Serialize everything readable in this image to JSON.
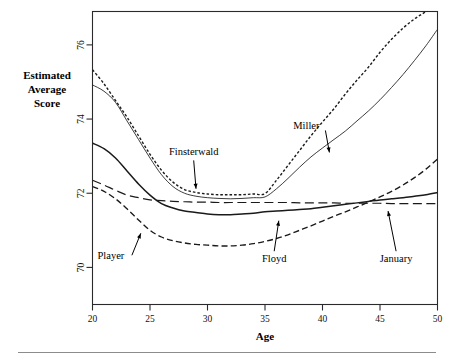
{
  "figure": {
    "background_color": "#ffffff",
    "frame_color": "#2a2a2a"
  },
  "chart_data": {
    "type": "line",
    "title": "",
    "subtitle": "",
    "xlabel": "Age",
    "ylabel": "Estimated Average Score",
    "xlim": [
      20,
      50
    ],
    "ylim": [
      69.0,
      76.9
    ],
    "grid": false,
    "legend_position": "inline-annotations",
    "x_ticks": [
      20,
      25,
      30,
      35,
      40,
      45,
      50
    ],
    "x_tick_labels": [
      "20",
      "25",
      "30",
      "35",
      "40",
      "45",
      "50"
    ],
    "y_ticks": [
      70,
      72,
      74,
      76
    ],
    "y_tick_labels": [
      "70",
      "72",
      "74",
      "76"
    ],
    "series": [
      {
        "name": "Finsterwald",
        "style": "dotted",
        "x": [
          20,
          21,
          22,
          23,
          24,
          25,
          26,
          27,
          28,
          29,
          30,
          31,
          32,
          33,
          34,
          35,
          36,
          37,
          38,
          39,
          40,
          41,
          42,
          43,
          44,
          45,
          46,
          47,
          48,
          49,
          50
        ],
        "y": [
          75.33,
          74.95,
          74.5,
          74.05,
          73.55,
          73.05,
          72.62,
          72.3,
          72.1,
          72.02,
          71.98,
          71.96,
          71.96,
          71.96,
          71.98,
          71.99,
          72.35,
          72.75,
          73.15,
          73.55,
          73.92,
          74.28,
          74.68,
          75.05,
          75.4,
          75.8,
          76.15,
          76.45,
          76.7,
          76.9,
          77.1
        ]
      },
      {
        "name": "Miller",
        "style": "solid-thin",
        "x": [
          20,
          21,
          22,
          23,
          24,
          25,
          26,
          27,
          28,
          29,
          30,
          31,
          32,
          33,
          34,
          35,
          36,
          37,
          38,
          39,
          40,
          41,
          42,
          43,
          44,
          45,
          46,
          47,
          48,
          49,
          50
        ],
        "y": [
          74.92,
          74.75,
          74.45,
          73.95,
          73.45,
          72.95,
          72.5,
          72.18,
          72.0,
          71.92,
          71.88,
          71.86,
          71.85,
          71.86,
          71.88,
          71.9,
          72.12,
          72.4,
          72.7,
          72.98,
          73.22,
          73.45,
          73.68,
          73.95,
          74.22,
          74.52,
          74.85,
          75.2,
          75.58,
          75.98,
          76.42
        ]
      },
      {
        "name": "Player",
        "style": "dashed",
        "x": [
          20,
          21,
          22,
          23,
          24,
          25,
          26,
          27,
          28,
          29,
          30,
          31,
          32,
          33,
          34,
          35,
          36,
          37,
          38,
          39,
          40,
          41,
          42,
          43,
          44,
          45,
          46,
          47,
          48,
          49,
          50
        ],
        "y": [
          72.18,
          72.05,
          71.85,
          71.58,
          71.28,
          71.0,
          70.82,
          70.72,
          70.66,
          70.62,
          70.6,
          70.58,
          70.58,
          70.6,
          70.64,
          70.7,
          70.78,
          70.88,
          71.0,
          71.12,
          71.25,
          71.38,
          71.5,
          71.63,
          71.76,
          71.9,
          72.05,
          72.22,
          72.42,
          72.65,
          72.92
        ]
      },
      {
        "name": "Floyd",
        "style": "solid",
        "x": [
          20,
          21,
          22,
          23,
          24,
          25,
          26,
          27,
          28,
          29,
          30,
          31,
          32,
          33,
          34,
          35,
          36,
          37,
          38,
          39,
          40,
          41,
          42,
          43,
          44,
          45,
          46,
          47,
          48,
          49,
          50
        ],
        "y": [
          73.35,
          73.2,
          72.95,
          72.6,
          72.25,
          71.95,
          71.72,
          71.6,
          71.52,
          71.48,
          71.44,
          71.42,
          71.42,
          71.44,
          71.46,
          71.5,
          71.52,
          71.54,
          71.56,
          71.58,
          71.62,
          71.66,
          71.7,
          71.74,
          71.78,
          71.82,
          71.85,
          71.88,
          71.92,
          71.96,
          72.02
        ]
      },
      {
        "name": "January",
        "style": "long-dash",
        "x": [
          20,
          21,
          22,
          23,
          24,
          25,
          26,
          27,
          28,
          29,
          30,
          31,
          32,
          33,
          34,
          35,
          36,
          37,
          38,
          39,
          40,
          41,
          42,
          43,
          44,
          45,
          46,
          47,
          48,
          49,
          50
        ],
        "y": [
          72.35,
          72.22,
          72.08,
          71.95,
          71.88,
          71.82,
          71.8,
          71.78,
          71.77,
          71.76,
          71.76,
          71.75,
          71.75,
          71.75,
          71.75,
          71.75,
          71.75,
          71.75,
          71.74,
          71.74,
          71.74,
          71.74,
          71.73,
          71.73,
          71.73,
          71.73,
          71.72,
          71.72,
          71.72,
          71.72,
          71.72
        ]
      }
    ],
    "annotations": [
      {
        "text": "Finsterwald",
        "label_x": 28.8,
        "label_y": 73.02,
        "arrow_to_x": 29.0,
        "arrow_to_y": 72.12,
        "arrow_kind": "down"
      },
      {
        "text": "Miller",
        "label_x": 38.6,
        "label_y": 73.72,
        "arrow_to_x": 40.6,
        "arrow_to_y": 73.1,
        "arrow_kind": "diagonal-down-right"
      },
      {
        "text": "Player",
        "label_x": 21.6,
        "label_y": 70.22,
        "arrow_to_x": 24.2,
        "arrow_to_y": 70.92,
        "arrow_kind": "diagonal-up-right"
      },
      {
        "text": "Floyd",
        "label_x": 35.8,
        "label_y": 70.14,
        "arrow_to_x": 36.2,
        "arrow_to_y": 71.26,
        "arrow_kind": "up"
      },
      {
        "text": "January",
        "label_x": 46.4,
        "label_y": 70.14,
        "arrow_to_x": 45.7,
        "arrow_to_y": 71.52,
        "arrow_kind": "up"
      }
    ]
  }
}
